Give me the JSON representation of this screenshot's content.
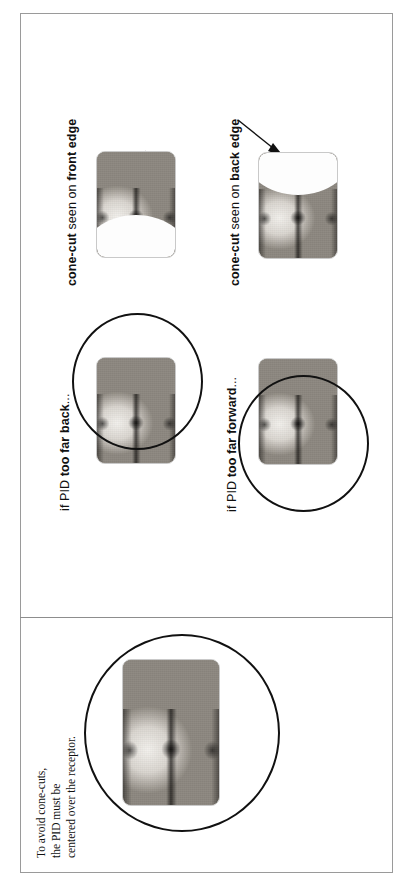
{
  "figure": {
    "orientation": "text-rotated-90-ccw",
    "panels": [
      {
        "id": "error-panel",
        "callouts": [
          {
            "prefix": "cone-cut",
            "middle": " seen on ",
            "emphasis": "front edge",
            "full": "cone-cut seen on front edge"
          },
          {
            "prefix": "cone-cut",
            "middle": " seen on ",
            "emphasis": "back edge",
            "full": "cone-cut seen on back edge"
          }
        ],
        "conditions": [
          {
            "prefix": "if PID ",
            "emphasis": "too far back",
            "suffix": "...",
            "full": "if PID too far back..."
          },
          {
            "prefix": "if PID ",
            "emphasis": "too far forward",
            "suffix": "...",
            "full": "if PID too far forward..."
          }
        ]
      },
      {
        "id": "correct-panel",
        "caption_lines": [
          "To avoid cone-cuts,",
          "the PID must be",
          "centered over the receptor."
        ],
        "caption_full": "To avoid cone-cuts, the PID must be centered over the receptor."
      }
    ],
    "images": [
      {
        "id": "xray-too-far-back-result",
        "alt": "bitewing radiograph with cone-cut on front edge"
      },
      {
        "id": "xray-too-far-forward-result",
        "alt": "bitewing radiograph with cone-cut on back edge"
      },
      {
        "id": "xray-too-far-back-setup",
        "alt": "bitewing radiograph with PID beam circle shifted back"
      },
      {
        "id": "xray-too-far-forward-setup",
        "alt": "bitewing radiograph with PID beam circle shifted forward"
      },
      {
        "id": "xray-correct-centered",
        "alt": "bitewing radiograph with PID beam circle centered over receptor"
      }
    ],
    "colors": {
      "frame_border": "#9a9a9a",
      "divider": "#8d8d8d",
      "pid_circle": "#111111",
      "arrow": "#111111",
      "film_border": "#c9c9c9",
      "cone_cut": "#fdfdfd",
      "text": "#111111",
      "background": "#ffffff"
    }
  }
}
